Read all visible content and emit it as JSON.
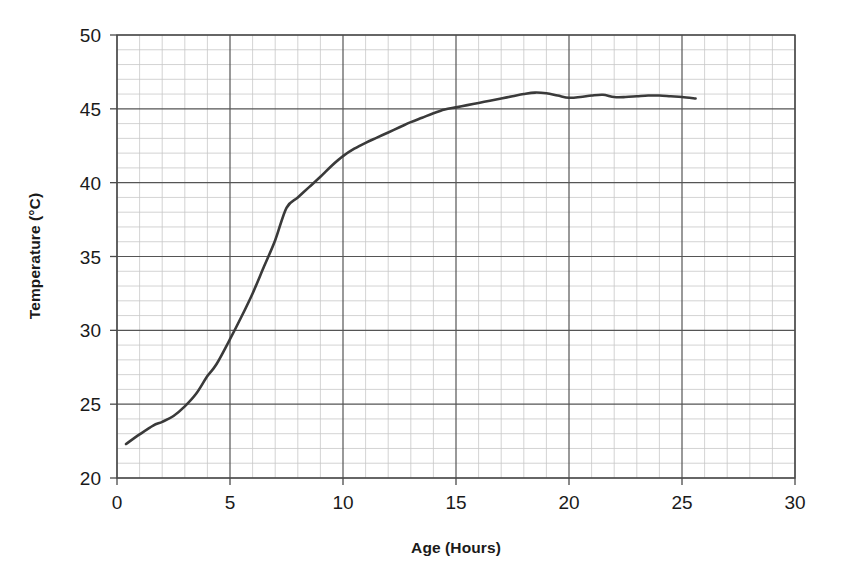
{
  "chart_data": {
    "type": "line",
    "title": "",
    "xlabel": "Age (Hours)",
    "ylabel": "Temperature (°C)",
    "xlim": [
      0,
      30
    ],
    "ylim": [
      20,
      50
    ],
    "x_major_ticks": [
      0,
      5,
      10,
      15,
      20,
      25,
      30
    ],
    "y_major_ticks": [
      20,
      25,
      30,
      35,
      40,
      45,
      50
    ],
    "x_tick_labels": [
      "0",
      "5",
      "10",
      "15",
      "20",
      "25",
      "30"
    ],
    "y_tick_labels": [
      "20",
      "25",
      "30",
      "35",
      "40",
      "45",
      "50"
    ],
    "x_minor_step": 1,
    "y_minor_step": 1,
    "grid": true,
    "grid_major_color": "#555555",
    "grid_minor_color": "#c8c8c8",
    "legend": null,
    "series": [
      {
        "name": "Temperature",
        "color": "#3a3a3a",
        "line_width": 2.6,
        "x": [
          0.4,
          1.0,
          1.6,
          2.0,
          2.5,
          3.0,
          3.5,
          4.0,
          4.4,
          5.0,
          5.5,
          6.0,
          6.5,
          7.0,
          7.5,
          8.0,
          8.5,
          9.0,
          9.5,
          10.0,
          10.5,
          11.0,
          11.5,
          12.0,
          12.5,
          13.0,
          13.5,
          14.0,
          14.5,
          15.0,
          15.5,
          16.0,
          16.5,
          17.0,
          17.5,
          18.0,
          18.5,
          19.0,
          19.5,
          20.0,
          20.5,
          21.0,
          21.5,
          22.0,
          22.5,
          23.0,
          23.5,
          24.0,
          24.5,
          25.0,
          25.6
        ],
        "y": [
          22.3,
          22.95,
          23.55,
          23.8,
          24.2,
          24.85,
          25.7,
          26.9,
          27.7,
          29.4,
          30.9,
          32.5,
          34.3,
          36.1,
          38.3,
          39.0,
          39.7,
          40.4,
          41.15,
          41.8,
          42.3,
          42.7,
          43.05,
          43.4,
          43.75,
          44.1,
          44.4,
          44.7,
          44.95,
          45.1,
          45.25,
          45.4,
          45.55,
          45.7,
          45.85,
          46.0,
          46.1,
          46.05,
          45.9,
          45.75,
          45.8,
          45.9,
          45.95,
          45.8,
          45.8,
          45.85,
          45.9,
          45.9,
          45.85,
          45.8,
          45.7
        ]
      }
    ]
  },
  "axes": {
    "x_title": "Age (Hours)",
    "y_title": "Temperature (°C)"
  }
}
